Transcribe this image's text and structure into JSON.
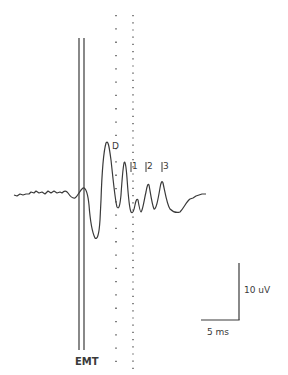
{
  "figure": {
    "type": "evoked potential waveform",
    "stimulus_label": "EMT",
    "peak_labels": {
      "D": "D",
      "I1": "1",
      "I2": "2",
      "I3": "3"
    },
    "scale_bar": {
      "vertical_label": "10 uV",
      "horizontal_label": "5 ms"
    },
    "colors": {
      "trace": "#3a3a3a",
      "background": "#ffffff"
    }
  }
}
